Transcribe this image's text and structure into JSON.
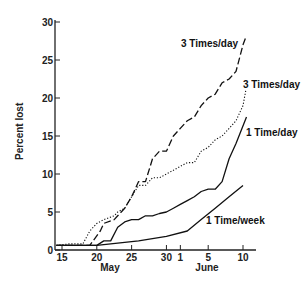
{
  "chart_data": {
    "type": "line",
    "title": "",
    "xlabel": "",
    "ylabel": "Percent lost",
    "ylim": [
      0,
      30
    ],
    "yticks": [
      0,
      5,
      10,
      15,
      20,
      25,
      30
    ],
    "xticks": [
      {
        "day": 15,
        "label": "15"
      },
      {
        "day": 20,
        "label": "20"
      },
      {
        "day": 25,
        "label": "25"
      },
      {
        "day": 30,
        "label": "30"
      },
      {
        "day": 32,
        "label": "1"
      },
      {
        "day": 36,
        "label": "5"
      },
      {
        "day": 41,
        "label": "10"
      }
    ],
    "month_labels": [
      {
        "label": "May",
        "day": 22.5
      },
      {
        "label": "June",
        "day": 36
      }
    ],
    "x_unit": "day (May 1 = 1; June 1 = 32)",
    "grid": false,
    "legend": "inline labels",
    "series": [
      {
        "name": "3 Times/day (dashed)",
        "label": "3 Times/day",
        "style": "dashed",
        "points": [
          [
            14.2,
            0.6
          ],
          [
            17,
            0.6
          ],
          [
            19,
            0.6
          ],
          [
            20.5,
            2.5
          ],
          [
            21,
            3.5
          ],
          [
            22.5,
            4
          ],
          [
            23,
            4.5
          ],
          [
            24,
            5.5
          ],
          [
            25,
            7
          ],
          [
            26,
            9
          ],
          [
            27,
            9
          ],
          [
            28,
            12
          ],
          [
            29,
            13
          ],
          [
            30,
            13
          ],
          [
            31,
            15
          ],
          [
            32,
            16
          ],
          [
            33,
            17
          ],
          [
            34,
            17.5
          ],
          [
            35,
            19
          ],
          [
            36,
            20
          ],
          [
            37,
            20.5
          ],
          [
            38,
            22
          ],
          [
            39,
            22.5
          ],
          [
            40,
            23.5
          ],
          [
            41,
            27
          ],
          [
            41.4,
            28
          ]
        ]
      },
      {
        "name": "3 Times/day (dotted)",
        "label": "3 Times/day",
        "style": "dotted",
        "points": [
          [
            14.2,
            0.6
          ],
          [
            16,
            0.8
          ],
          [
            18,
            0.8
          ],
          [
            19,
            2.5
          ],
          [
            20,
            3.5
          ],
          [
            21,
            4
          ],
          [
            22.5,
            4.5
          ],
          [
            23,
            5
          ],
          [
            24,
            5.5
          ],
          [
            25,
            7
          ],
          [
            26,
            8.5
          ],
          [
            27,
            8.5
          ],
          [
            28,
            9.5
          ],
          [
            29,
            9.5
          ],
          [
            30,
            10
          ],
          [
            31,
            10.5
          ],
          [
            32,
            11
          ],
          [
            33,
            11.5
          ],
          [
            34,
            11.5
          ],
          [
            35,
            13
          ],
          [
            36,
            13.5
          ],
          [
            37,
            14.5
          ],
          [
            38,
            15
          ],
          [
            39,
            16
          ],
          [
            40,
            17
          ],
          [
            41,
            19
          ],
          [
            41.4,
            21
          ]
        ]
      },
      {
        "name": "1 Time/day",
        "label": "1 Time/day",
        "style": "solid",
        "points": [
          [
            14.2,
            0.6
          ],
          [
            20,
            0.6
          ],
          [
            21,
            1.2
          ],
          [
            22,
            1.2
          ],
          [
            23,
            3
          ],
          [
            24,
            3.7
          ],
          [
            25,
            4
          ],
          [
            26,
            4
          ],
          [
            27,
            4.5
          ],
          [
            28,
            4.5
          ],
          [
            29,
            4.8
          ],
          [
            30,
            5
          ],
          [
            31,
            5.5
          ],
          [
            32,
            6
          ],
          [
            33,
            6.5
          ],
          [
            34,
            7
          ],
          [
            35,
            7.7
          ],
          [
            36,
            8
          ],
          [
            37,
            8
          ],
          [
            38,
            9
          ],
          [
            39,
            12
          ],
          [
            40,
            14
          ],
          [
            41.5,
            17.5
          ]
        ]
      },
      {
        "name": "1 Time/week",
        "label": "1 Time/week",
        "style": "solid",
        "points": [
          [
            14.2,
            0.6
          ],
          [
            20,
            0.6
          ],
          [
            22,
            0.8
          ],
          [
            26,
            1.2
          ],
          [
            30,
            1.8
          ],
          [
            33,
            2.5
          ],
          [
            35,
            4
          ],
          [
            37,
            5.5
          ],
          [
            39,
            7
          ],
          [
            41,
            8.5
          ]
        ]
      }
    ],
    "annotations": [
      {
        "text": "3 Times/day",
        "near_series": "3 Times/day (dashed)"
      },
      {
        "text": "3 Times/day",
        "near_series": "3 Times/day (dotted)"
      },
      {
        "text": "1 Time/day",
        "near_series": "1 Time/day"
      },
      {
        "text": "1 Time/week",
        "near_series": "1 Time/week"
      }
    ]
  },
  "labels": {
    "ylabel": "Percent lost",
    "may": "May",
    "june": "June",
    "s1": "3 Times/day",
    "s2": "3 Times/day",
    "s3": "1 Time/day",
    "s4": "1 Time/week"
  },
  "y_tick_labels": [
    "0",
    "5",
    "10",
    "15",
    "20",
    "25",
    "30"
  ],
  "x_tick_labels": [
    "15",
    "20",
    "25",
    "30",
    "1",
    "5",
    "10"
  ]
}
